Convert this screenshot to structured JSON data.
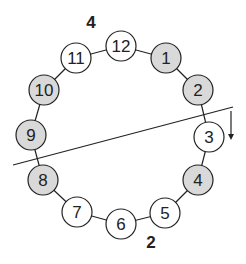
{
  "diagram": {
    "top_label": "4",
    "bottom_label": "2",
    "nodes": [
      {
        "label": "12",
        "x": 121,
        "y": 46,
        "shaded": false
      },
      {
        "label": "1",
        "x": 166,
        "y": 58,
        "shaded": true
      },
      {
        "label": "2",
        "x": 198,
        "y": 90,
        "shaded": true
      },
      {
        "label": "3",
        "x": 209,
        "y": 137,
        "shaded": false
      },
      {
        "label": "4",
        "x": 198,
        "y": 180,
        "shaded": true
      },
      {
        "label": "5",
        "x": 165,
        "y": 213,
        "shaded": false
      },
      {
        "label": "6",
        "x": 121,
        "y": 224,
        "shaded": false
      },
      {
        "label": "7",
        "x": 77,
        "y": 212,
        "shaded": false
      },
      {
        "label": "8",
        "x": 43,
        "y": 180,
        "shaded": true
      },
      {
        "label": "9",
        "x": 31,
        "y": 135,
        "shaded": true
      },
      {
        "label": "10",
        "x": 44,
        "y": 90,
        "shaded": true
      },
      {
        "label": "11",
        "x": 76,
        "y": 58,
        "shaded": false
      }
    ],
    "cut_line": {
      "x1": 13,
      "y1": 165,
      "x2": 233,
      "y2": 107
    },
    "arrow": {
      "x": 231,
      "y1": 111,
      "y2": 140,
      "direction": "down"
    },
    "colors": {
      "shaded": "#d9d9d9",
      "unshaded": "#ffffff",
      "stroke": "#222222"
    }
  }
}
